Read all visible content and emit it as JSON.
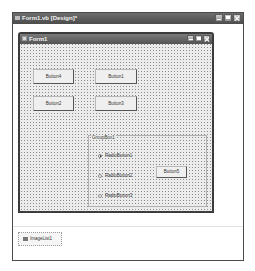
{
  "designer": {
    "title": "Form1.vb [Design]*",
    "window_buttons": [
      "minimize",
      "maximize",
      "close"
    ]
  },
  "form": {
    "title": "Form1",
    "window_buttons": [
      "minimize",
      "maximize",
      "close"
    ],
    "buttons": [
      {
        "id": "button4",
        "label": "Button4"
      },
      {
        "id": "button1",
        "label": "Button1"
      },
      {
        "id": "button2",
        "label": "Button2"
      },
      {
        "id": "button3",
        "label": "Button3"
      }
    ],
    "groupbox": {
      "label": "GroupBox1",
      "radios": [
        {
          "label": "RadioButton1",
          "checked": true
        },
        {
          "label": "RadioButton2",
          "checked": false
        },
        {
          "label": "RadioButton3",
          "checked": false
        }
      ],
      "button": {
        "label": "Button5"
      }
    }
  },
  "component_tray": {
    "items": [
      {
        "label": "ImageList1",
        "icon": "imagelist-icon"
      }
    ]
  },
  "colors": {
    "title_bar": "#555555",
    "form_background": "#ececec",
    "grid_dot": "#8a8a8a"
  }
}
